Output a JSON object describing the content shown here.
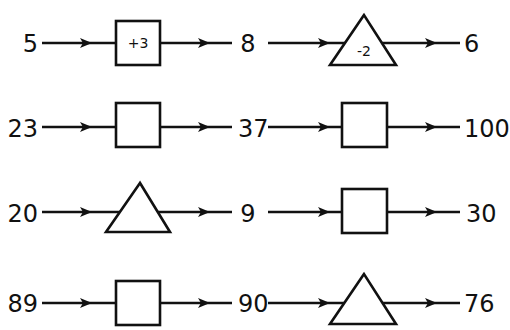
{
  "rows": [
    {
      "start": "5",
      "shape1": "square",
      "op1": "+3",
      "mid": "8",
      "shape2": "triangle",
      "op2": "-2",
      "end": "6"
    },
    {
      "start": "23",
      "shape1": "square",
      "op1": "",
      "mid": "37",
      "shape2": "square",
      "op2": "",
      "end": "100"
    },
    {
      "start": "20",
      "shape1": "triangle",
      "op1": "",
      "mid": "9",
      "shape2": "square",
      "op2": "",
      "end": "30"
    },
    {
      "start": "89",
      "shape1": "square",
      "op1": "",
      "mid": "90",
      "shape2": "triangle",
      "op2": "",
      "end": "76"
    }
  ]
}
